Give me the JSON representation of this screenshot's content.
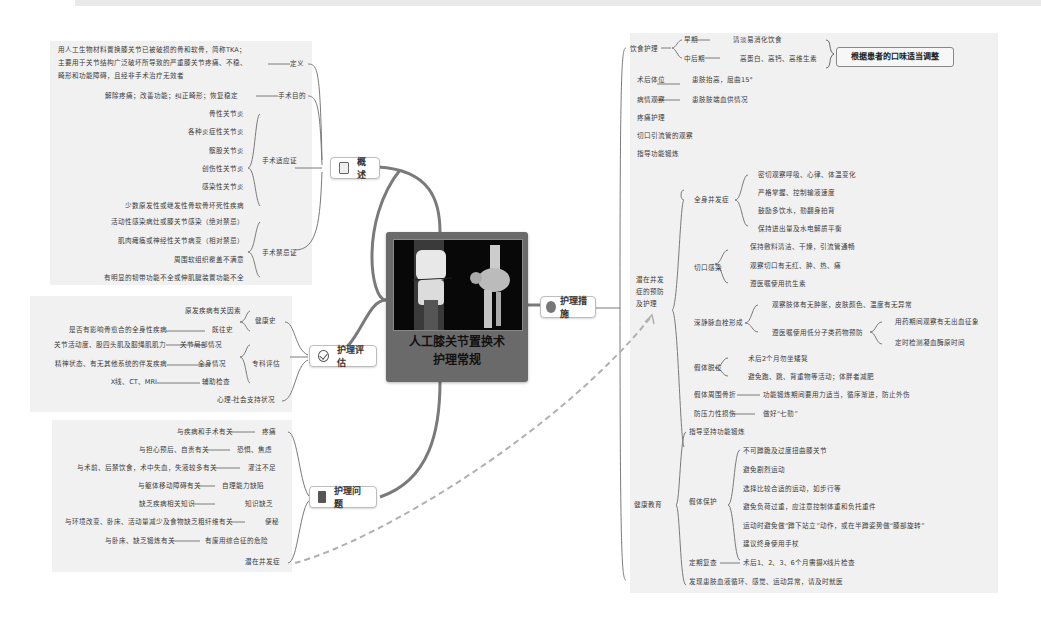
{
  "center": {
    "title_line1": "人工膝关节置换术",
    "title_line2": "护理常规",
    "image": "knee-xray-and-3d-ct"
  },
  "branches": {
    "overview": {
      "label": "概述",
      "icon": "document-icon",
      "definition": {
        "label": "定义",
        "lines": [
          "用人工生物材料置换膝关节已被破损的骨和软骨，简称TKA；",
          "主要用于关节结构广泛破坏所导致的严重膝关节疼痛、不稳、",
          "畸形和功能障碍，且经非手术治疗无效者"
        ]
      },
      "purpose": {
        "label": "手术目的",
        "text": "解除疼痛；改善功能；纠正畸形；恢复稳定"
      },
      "indications": {
        "label": "手术适应证",
        "items": [
          "骨性关节炎",
          "各种炎症性关节炎",
          "髌股关节炎",
          "创伤性关节炎",
          "感染性关节炎",
          "少数原发性或继发性骨软骨坏死性疾病"
        ]
      },
      "contraindications": {
        "label": "手术禁忌证",
        "items": [
          "活动性感染病灶或膝关节感染（绝对禁忌）",
          "肌肉瘫痪或神经性关节病变（相对禁忌）",
          "周围软组织覆盖不满意",
          "有明显的韧带功能不全或伸肌腱装置功能不全"
        ]
      }
    },
    "assessment": {
      "label": "护理评估",
      "icon": "check-circle-icon",
      "health_history": {
        "label": "健康史",
        "items": [
          {
            "text": "原发疾病有关因素"
          },
          {
            "text": "是否有影响骨愈合的全身性疾病",
            "sub": "既往史"
          }
        ]
      },
      "specialty": {
        "label": "专科评估",
        "items": [
          {
            "detail": "关节活动度、股四头肌及腘绳肌肌力",
            "text": "关节局部情况"
          },
          {
            "detail": "精神状态、有无其他系统的伴发疾病",
            "text": "全身情况"
          },
          {
            "detail": "X线、CT、MRI",
            "text": "辅助检查"
          }
        ]
      },
      "psycho": "心理-社会支持状况"
    },
    "problems": {
      "label": "护理问题",
      "icon": "notepad-icon",
      "items": [
        {
          "cause": "与疾病和手术有关",
          "problem": "疼痛"
        },
        {
          "cause": "与担心预后、自责有关",
          "problem": "恐惧、焦虑"
        },
        {
          "cause": "与术前、后禁饮食，术中失血，失液较多有关",
          "problem": "灌注不足"
        },
        {
          "cause": "与躯体移动障碍有关",
          "problem": "自理能力缺陷"
        },
        {
          "cause": "缺乏疾病相关知识",
          "problem": "知识缺乏"
        },
        {
          "cause": "与环境改变、卧床、活动量减少及食物缺乏粗纤维有关",
          "problem": "便秘"
        },
        {
          "cause": "与卧床、缺乏锻炼有关",
          "problem": "有废用综合征的危险"
        },
        {
          "cause": "",
          "problem": "潜在并发症"
        }
      ]
    },
    "measures": {
      "label": "护理措施",
      "icon": "smile-circle-icon",
      "diet": {
        "label": "饮食护理",
        "early": {
          "label": "早期",
          "text": "清淡易消化饮食"
        },
        "mid_late": {
          "label": "中后期",
          "text": "高蛋白、高钙、高维生素"
        },
        "callout": "根据患者的口味适当调整"
      },
      "position": {
        "label": "术后体位",
        "text": "患肢抬高，屈曲15°"
      },
      "observation": {
        "label": "病情观察",
        "text": "患肢肢端血供情况"
      },
      "pain": "疼痛护理",
      "drain": "切口引流管的观察",
      "exercise": "指导功能锻炼",
      "complications": {
        "label_lines": [
          "潜在并发",
          "症的预防",
          "及护理"
        ],
        "systemic": {
          "label": "全身并发症",
          "items": [
            "密切观察呼吸、心律、体温变化",
            "严格掌握、控制输液速度",
            "鼓励多饮水，勤翻身拍背",
            "保持进出量及水电解质平衡"
          ]
        },
        "incision": {
          "label": "切口感染",
          "items": [
            "保持敷料清洁、干燥，引流管通畅",
            "观察切口有无红、肿、热、痛",
            "遵医嘱使用抗生素"
          ]
        },
        "dvt": {
          "label": "深静脉血栓形成",
          "item1": "观察肢体有无肿胀，皮肤颜色、温度有无异常",
          "item2": "遵医嘱使用低分子类药物预防",
          "sub": [
            "用药期间观察有无出血征象",
            "定时检测凝血酶原时间"
          ]
        },
        "dislocation": {
          "label": "假体脱位",
          "items": [
            "术后2个月勿坐矮凳",
            "避免跑、跳、背重物等活动；体胖者减肥"
          ]
        },
        "fracture": {
          "label": "假体周围骨折",
          "text": "功能锻炼期间要用力适当，循序渐进，防止外伤"
        },
        "pressure": {
          "label": "防压力性损伤",
          "text": "做好“七勤”"
        }
      },
      "education": {
        "label": "健康教育",
        "guide": "指导坚持功能锻炼",
        "protection": {
          "label": "假体保护",
          "items": [
            "不可蹲跪及过度扭曲膝关节",
            "避免剧烈运动",
            "选择比较合适的运动，如步行等",
            "避免负荷过重，应注意控制体重和负托重件",
            "运动时避免做“蹲下站立”动作，或在半蹲姿势做“膝部旋转”",
            "建议终身使用手杖"
          ]
        },
        "review": {
          "label": "定期复查",
          "text": "术后1、2、3、6个月需摄X线片检查"
        },
        "notice": "发现患肢血液循环、感觉、运动异常，请及时就医"
      }
    }
  },
  "colors": {
    "branch_line": "#7a7a7a",
    "panel_bg": "#f1f1f1",
    "center_bg": "#6a6a6a",
    "dashed_link": "#b0b0b0"
  }
}
